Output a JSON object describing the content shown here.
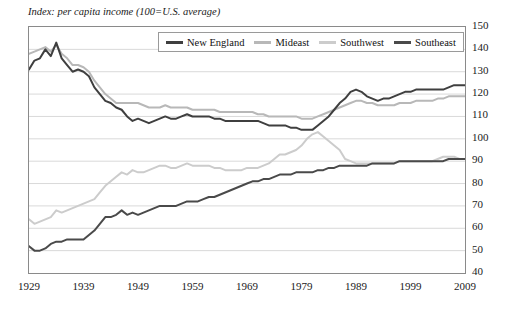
{
  "note": "Index: per capita income (100=U.S. average)",
  "chart_data": {
    "type": "line",
    "title": "",
    "subtitle": "",
    "xlabel": "",
    "ylabel": "Index: per capita income (100=U.S. average)",
    "grid": true,
    "grid_axis": "y",
    "legend_position": "top-center",
    "xlim": [
      1929,
      2009
    ],
    "ylim": [
      40,
      150
    ],
    "yticks": [
      40,
      50,
      60,
      70,
      80,
      90,
      100,
      110,
      120,
      130,
      140,
      150
    ],
    "xticks": [
      1929,
      1939,
      1949,
      1959,
      1969,
      1979,
      1989,
      1999,
      2009
    ],
    "x": [
      1929,
      1930,
      1931,
      1932,
      1933,
      1934,
      1935,
      1936,
      1937,
      1938,
      1939,
      1940,
      1941,
      1942,
      1943,
      1944,
      1945,
      1946,
      1947,
      1948,
      1949,
      1950,
      1951,
      1952,
      1953,
      1954,
      1955,
      1956,
      1957,
      1958,
      1959,
      1960,
      1961,
      1962,
      1963,
      1964,
      1965,
      1966,
      1967,
      1968,
      1969,
      1970,
      1971,
      1972,
      1973,
      1974,
      1975,
      1976,
      1977,
      1978,
      1979,
      1980,
      1981,
      1982,
      1983,
      1984,
      1985,
      1986,
      1987,
      1988,
      1989,
      1990,
      1991,
      1992,
      1993,
      1994,
      1995,
      1996,
      1997,
      1998,
      1999,
      2000,
      2001,
      2002,
      2003,
      2004,
      2005,
      2006,
      2007,
      2008,
      2009
    ],
    "series": [
      {
        "name": "New England",
        "color": "#3f3f3f",
        "values": [
          131,
          135,
          136,
          140,
          137,
          143,
          136,
          133,
          130,
          131,
          130,
          128,
          123,
          120,
          117,
          116,
          114,
          113,
          110,
          108,
          109,
          108,
          107,
          108,
          109,
          110,
          109,
          109,
          110,
          111,
          110,
          110,
          110,
          110,
          109,
          109,
          108,
          108,
          108,
          108,
          108,
          108,
          108,
          107,
          106,
          106,
          106,
          106,
          105,
          105,
          104,
          104,
          104,
          106,
          108,
          110,
          113,
          116,
          118,
          121,
          122,
          121,
          119,
          118,
          117,
          118,
          118,
          119,
          120,
          121,
          121,
          122,
          122,
          122,
          122,
          122,
          122,
          123,
          124,
          124,
          124
        ]
      },
      {
        "name": "Mideast",
        "color": "#b8b8b8",
        "values": [
          138,
          139,
          140,
          141,
          139,
          142,
          138,
          136,
          133,
          133,
          132,
          130,
          126,
          123,
          120,
          118,
          116,
          116,
          116,
          116,
          116,
          115,
          114,
          114,
          114,
          115,
          114,
          114,
          114,
          114,
          113,
          113,
          113,
          113,
          113,
          112,
          112,
          112,
          112,
          112,
          112,
          112,
          111,
          111,
          110,
          110,
          110,
          110,
          110,
          110,
          109,
          109,
          109,
          110,
          111,
          112,
          113,
          114,
          115,
          116,
          117,
          117,
          116,
          116,
          115,
          115,
          115,
          115,
          116,
          116,
          116,
          117,
          117,
          117,
          117,
          118,
          118,
          119,
          119,
          119,
          119
        ]
      },
      {
        "name": "Southwest",
        "color": "#cccccc",
        "values": [
          64,
          62,
          63,
          64,
          65,
          68,
          67,
          68,
          69,
          70,
          71,
          72,
          73,
          76,
          79,
          81,
          83,
          85,
          84,
          86,
          85,
          85,
          86,
          87,
          88,
          88,
          87,
          87,
          88,
          89,
          88,
          88,
          88,
          88,
          87,
          87,
          86,
          86,
          86,
          86,
          87,
          87,
          87,
          88,
          89,
          91,
          93,
          93,
          94,
          95,
          97,
          100,
          102,
          103,
          101,
          99,
          97,
          95,
          91,
          90,
          89,
          89,
          89,
          89,
          89,
          89,
          89,
          89,
          90,
          90,
          90,
          90,
          90,
          90,
          90,
          91,
          92,
          92,
          92,
          91,
          91
        ]
      },
      {
        "name": "Southeast",
        "color": "#4a4a4a",
        "values": [
          52,
          50,
          50,
          51,
          53,
          54,
          54,
          55,
          55,
          55,
          55,
          57,
          59,
          62,
          65,
          65,
          66,
          68,
          66,
          67,
          66,
          67,
          68,
          69,
          70,
          70,
          70,
          70,
          71,
          72,
          72,
          72,
          73,
          74,
          74,
          75,
          76,
          77,
          78,
          79,
          80,
          81,
          81,
          82,
          82,
          83,
          84,
          84,
          84,
          85,
          85,
          85,
          85,
          86,
          86,
          87,
          87,
          88,
          88,
          88,
          88,
          88,
          88,
          89,
          89,
          89,
          89,
          89,
          90,
          90,
          90,
          90,
          90,
          90,
          90,
          90,
          90,
          91,
          91,
          91,
          91
        ]
      }
    ]
  }
}
